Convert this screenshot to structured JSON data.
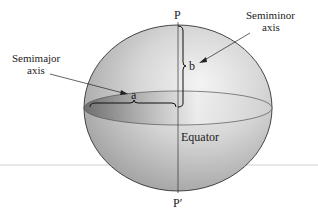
{
  "figure": {
    "type": "ellipsoid-diagram",
    "labels": {
      "north_pole": "P",
      "south_pole": "P′",
      "semiminor_title_line1": "Semiminor",
      "semiminor_title_line2": "axis",
      "semimajor_title_line1": "Semimajor",
      "semimajor_title_line2": "axis",
      "semimajor_symbol": "a",
      "semiminor_symbol": "b",
      "equator": "Equator"
    },
    "colors": {
      "ellipsoid_light": "#f2f2f2",
      "ellipsoid_dark": "#9a9a9a",
      "outline": "#333333",
      "baseline": "#bfbfbf",
      "text": "#222222"
    }
  }
}
